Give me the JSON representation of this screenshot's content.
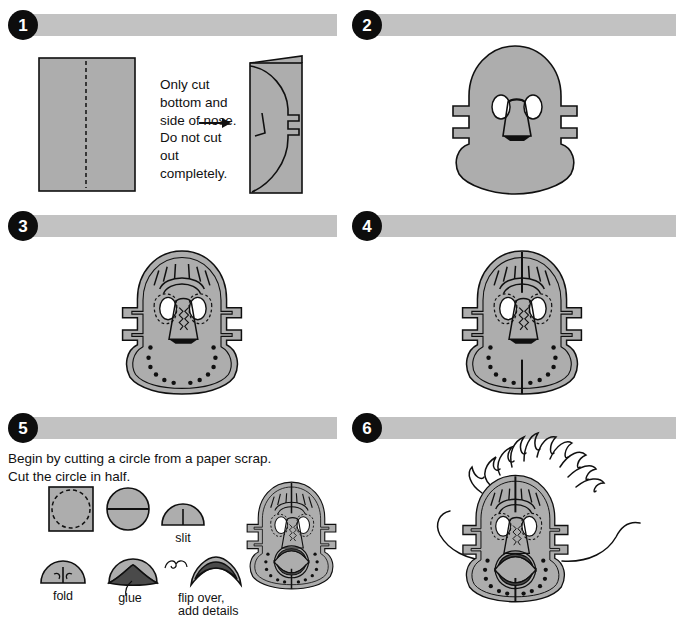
{
  "document": {
    "title": "Paper Mask Craft Instructions",
    "step_count": 6
  },
  "palette": {
    "bar_gray": "#c2c2c2",
    "paper_gray": "#adadad",
    "outline_black": "#101010",
    "badge_black": "#0d0d0d",
    "badge_text": "#ffffff",
    "eye_white": "#ffffff",
    "mouth_dark": "#4a4a4a",
    "page_background": "#ffffff"
  },
  "steps": [
    {
      "number": "1",
      "badge_label": "1",
      "note": "Only cut bottom and side of nose. Do not cut out completely.",
      "figures": [
        {
          "name": "folded-paper-with-crease",
          "label": ""
        },
        {
          "name": "arrow-right",
          "label": ""
        },
        {
          "name": "folded-half-with-mask-outline",
          "label": ""
        }
      ]
    },
    {
      "number": "2",
      "badge_label": "2",
      "note": "",
      "figures": [
        {
          "name": "cut-out-mask-blank",
          "label": ""
        }
      ]
    },
    {
      "number": "3",
      "badge_label": "3",
      "note": "",
      "figures": [
        {
          "name": "mask-with-decorations",
          "label": ""
        }
      ]
    },
    {
      "number": "4",
      "badge_label": "4",
      "note": "",
      "figures": [
        {
          "name": "mask-with-top-and-bottom-slits",
          "label": ""
        }
      ]
    },
    {
      "number": "5",
      "badge_label": "5",
      "note": "Begin by cutting a circle from a paper scrap.\nCut the circle in half.",
      "note_line_1": "Begin by cutting a circle from a paper scrap.",
      "note_line_2": "Cut the circle in half.",
      "figures": [
        {
          "name": "paper-scrap-with-circle-outline",
          "label": ""
        },
        {
          "name": "circle-cut-in-half",
          "label": ""
        },
        {
          "name": "half-circle-with-slit",
          "label": "slit"
        },
        {
          "name": "half-circle-folded",
          "label": "fold"
        },
        {
          "name": "half-circle-glued",
          "label": "glue"
        },
        {
          "name": "half-circle-flipped",
          "label": "flip over,\nadd details"
        },
        {
          "name": "mask-with-mouth",
          "label": ""
        }
      ],
      "labels": {
        "slit": "slit",
        "fold": "fold",
        "glue": "glue",
        "flip_line_1": "flip over,",
        "flip_line_2": "add details"
      }
    },
    {
      "number": "6",
      "badge_label": "6",
      "note": "",
      "figures": [
        {
          "name": "finished-mask-with-hair-and-whiskers",
          "label": ""
        }
      ]
    }
  ]
}
